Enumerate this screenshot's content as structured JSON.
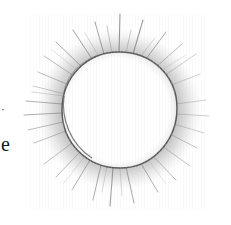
{
  "page": {
    "background_color": "#ffffff",
    "width": 231,
    "height": 225
  },
  "margin_text": {
    "fragment_letter": "e",
    "fragment_mark": "·"
  },
  "drawing": {
    "subject_name": "sun-sketch",
    "medium": "graphite pencil on paper",
    "ink_color": "#6e6e6e",
    "outline_color": "#555555",
    "halo_color": "#b8b8b8",
    "ray_color": "#7a7a7a",
    "core": {
      "label": "sun-disc",
      "center_x": 119,
      "center_y": 110,
      "radius_x": 58,
      "radius_y": 58,
      "fill": "#ffffff"
    },
    "halo": {
      "label": "sun-halo",
      "inner_radius": 57,
      "outer_radius": 84,
      "opacity": 0.38
    },
    "rays": {
      "label": "sun-rays",
      "count": 34,
      "min_length": 14,
      "max_length": 46
    }
  }
}
